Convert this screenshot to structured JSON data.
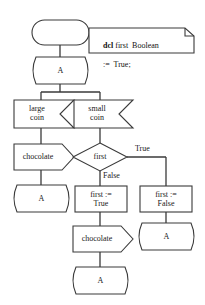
{
  "diagram": {
    "type": "sdl-process-flowchart",
    "stroke_color": "#3a3a3a",
    "fill_color": "#ffffff",
    "text_color": "#1a1a1a",
    "start": {
      "shape": "start-stadium",
      "label": ""
    },
    "note": {
      "keyword": "dcl",
      "line1_rest": " first  Boolean",
      "line2": ":=  True;"
    },
    "connectors": {
      "top": "A",
      "after_chocolate_left": "A",
      "after_chocolate_bottom": "A",
      "after_first_false": "A"
    },
    "inputs": {
      "large_coin_line1": "large",
      "large_coin_line2": "coin",
      "small_coin_line1": "small",
      "small_coin_line2": "coin"
    },
    "outputs": {
      "chocolate_left": "chocolate",
      "chocolate_bottom": "chocolate"
    },
    "decision": {
      "label": "first",
      "branch_true": "True",
      "branch_false": "False"
    },
    "tasks": {
      "set_true_line1": "first :=",
      "set_true_line2": "True",
      "set_false_line1": "first :=",
      "set_false_line2": "False"
    }
  }
}
